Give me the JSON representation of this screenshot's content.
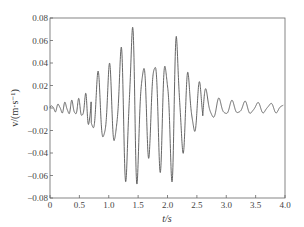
{
  "chart_data": {
    "type": "line",
    "title": "",
    "xlabel": "t/s",
    "ylabel": "v/(m·s⁻¹)",
    "xlim": [
      0,
      4.0
    ],
    "ylim": [
      -0.08,
      0.08
    ],
    "x_ticks": [
      "0",
      "0.5",
      "1.0",
      "1.5",
      "2.0",
      "2.5",
      "3.0",
      "3.5",
      "4.0"
    ],
    "y_ticks": [
      "0.08",
      "0.06",
      "0.04",
      "0.02",
      "0",
      "-0.02",
      "-0.04",
      "-0.06",
      "-0.08"
    ],
    "grid": false,
    "legend": null,
    "series": [
      {
        "name": "velocity",
        "color": "#555555",
        "description": "Seismic-like velocity time history; small oscillations 0-0.6 s, growing to peak ~0.065 / -0.072 near 1.35-1.45 s, secondary burst ~0.06 near 2.1-2.2 s, decaying to ~±0.005 by 3.0-4.0 s",
        "x": [
          0.0,
          0.1,
          0.2,
          0.3,
          0.4,
          0.5,
          0.6,
          0.7,
          0.8,
          0.9,
          1.0,
          1.1,
          1.2,
          1.3,
          1.35,
          1.4,
          1.45,
          1.5,
          1.6,
          1.7,
          1.8,
          1.9,
          2.0,
          2.1,
          2.15,
          2.2,
          2.3,
          2.4,
          2.5,
          2.6,
          2.7,
          2.8,
          2.9,
          3.0,
          3.2,
          3.4,
          3.6,
          3.8,
          3.95
        ],
        "envelope": [
          0.002,
          0.003,
          0.004,
          0.005,
          0.006,
          0.007,
          0.01,
          0.02,
          0.025,
          0.032,
          0.033,
          0.03,
          0.045,
          0.062,
          0.065,
          0.07,
          0.068,
          0.05,
          0.04,
          0.035,
          0.05,
          0.045,
          0.04,
          0.06,
          0.062,
          0.052,
          0.03,
          0.025,
          0.02,
          0.018,
          0.012,
          0.008,
          0.007,
          0.006,
          0.005,
          0.005,
          0.004,
          0.004,
          0.003
        ]
      }
    ],
    "frequency_hz": 5.2
  }
}
